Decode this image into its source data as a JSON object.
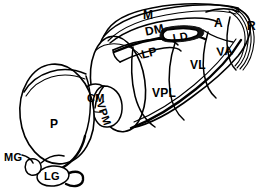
{
  "figure": {
    "name": "thalamus-nuclei-diagram",
    "type": "anatomical-line-drawing",
    "background_color": "#ffffff",
    "line_color": "#000000",
    "view": "dorsolateral oblique view of the thalamus"
  },
  "labels": {
    "m": "M",
    "dm": "DM",
    "ld": "LD",
    "a": "A",
    "r": "R",
    "va": "VA",
    "vl": "VL",
    "lp": "LP",
    "vpl": "VPL",
    "vpm": "VPM",
    "cm": "CM",
    "p": "P",
    "mg": "MG",
    "lg": "LG"
  },
  "label_positions": {
    "m": {
      "x": 143,
      "y": 9,
      "size": "lg",
      "rotate": 0
    },
    "dm": {
      "x": 144,
      "y": 26,
      "size": "lg",
      "rotate": -12
    },
    "ld": {
      "x": 172,
      "y": 33,
      "size": "md",
      "rotate": -10
    },
    "a": {
      "x": 214,
      "y": 17,
      "size": "lg",
      "rotate": 0
    },
    "r": {
      "x": 247,
      "y": 20,
      "size": "lg",
      "rotate": 0
    },
    "va": {
      "x": 216,
      "y": 46,
      "size": "lg",
      "rotate": -6
    },
    "vl": {
      "x": 190,
      "y": 59,
      "size": "lg",
      "rotate": 0
    },
    "lp": {
      "x": 140,
      "y": 49,
      "size": "lg",
      "rotate": -14
    },
    "vpl": {
      "x": 152,
      "y": 87,
      "size": "lg",
      "rotate": 0
    },
    "vpm": {
      "x": 105,
      "y": 100,
      "size": "md",
      "rotate": 72
    },
    "cm": {
      "x": 87,
      "y": 95,
      "size": "md",
      "rotate": 0
    },
    "p": {
      "x": 50,
      "y": 118,
      "size": "lg",
      "rotate": 0
    },
    "mg": {
      "x": 4,
      "y": 152,
      "size": "md",
      "rotate": 0
    },
    "lg": {
      "x": 44,
      "y": 170,
      "size": "md",
      "rotate": 0
    }
  },
  "regions": [
    {
      "key": "m",
      "name": "midline-nuclei",
      "abbrev": "M"
    },
    {
      "key": "dm",
      "name": "dorsomedial-nucleus",
      "abbrev": "DM"
    },
    {
      "key": "ld",
      "name": "lateral-dorsal-nucleus",
      "abbrev": "LD"
    },
    {
      "key": "a",
      "name": "anterior-nucleus",
      "abbrev": "A"
    },
    {
      "key": "r",
      "name": "reticular-nucleus",
      "abbrev": "R"
    },
    {
      "key": "va",
      "name": "ventral-anterior-nucleus",
      "abbrev": "VA"
    },
    {
      "key": "vl",
      "name": "ventral-lateral-nucleus",
      "abbrev": "VL"
    },
    {
      "key": "lp",
      "name": "lateral-posterior-nucleus",
      "abbrev": "LP"
    },
    {
      "key": "vpl",
      "name": "ventral-posterolateral-nucleus",
      "abbrev": "VPL"
    },
    {
      "key": "vpm",
      "name": "ventral-posteromedial-nucleus",
      "abbrev": "VPM"
    },
    {
      "key": "cm",
      "name": "centromedian-nucleus",
      "abbrev": "CM"
    },
    {
      "key": "p",
      "name": "pulvinar",
      "abbrev": "P"
    },
    {
      "key": "mg",
      "name": "medial-geniculate-body",
      "abbrev": "MG"
    },
    {
      "key": "lg",
      "name": "lateral-geniculate-body",
      "abbrev": "LG"
    }
  ]
}
